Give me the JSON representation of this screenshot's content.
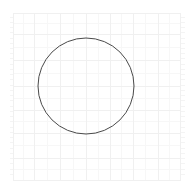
{
  "figure": {
    "width": 191,
    "height": 193,
    "background_color": "#ffffff",
    "title": "",
    "has_axis_labels": false,
    "has_tick_labels": false,
    "has_legend": false
  },
  "plot_area": {
    "left": 13,
    "top": 13,
    "right": 180,
    "bottom": 180,
    "frame_color": "#f0f0f0",
    "background_color": "#ffffff"
  },
  "grid": {
    "visible": true,
    "major_color": "#f0f0f0",
    "minor_color": "#f7f7f7",
    "tick_color": "#f4f4f4",
    "x_major": [
      13,
      34,
      60,
      86,
      110,
      133,
      158,
      180
    ],
    "y_major": [
      13,
      34,
      60,
      86,
      110,
      133,
      158,
      180
    ],
    "x_minor": [
      23,
      47,
      73,
      98,
      121,
      145,
      169
    ],
    "y_minor": [
      23,
      47,
      73,
      98,
      121,
      145,
      169
    ],
    "left_tick_y": [
      17,
      22,
      27,
      32,
      38,
      43,
      48,
      53,
      58,
      64,
      69,
      74,
      79,
      85,
      90,
      95,
      100,
      106,
      111,
      116,
      121,
      127,
      132,
      137,
      142,
      148,
      153,
      158,
      163,
      169,
      174
    ],
    "right_tick_y": [
      17,
      22,
      27,
      32,
      38,
      43,
      48,
      53,
      58,
      64,
      69,
      74,
      79,
      85,
      90,
      95,
      100,
      106,
      111,
      116,
      121,
      127,
      132,
      137,
      142,
      148,
      153,
      158,
      163,
      169,
      174
    ],
    "tick_length": 4
  },
  "chart_data": {
    "type": "scatter",
    "title": "",
    "xlabel": "",
    "ylabel": "",
    "grid": true,
    "legend_position": "none",
    "xlim": [
      13,
      180
    ],
    "ylim": [
      13,
      180
    ],
    "shapes": [
      {
        "name": "circle",
        "kind": "circle",
        "cx": 86,
        "cy": 86,
        "r": 48,
        "stroke": "#4a4a4a",
        "stroke_width": 1,
        "fill": "none"
      }
    ],
    "x": [
      86
    ],
    "y": [
      86
    ],
    "values": [
      48
    ],
    "categories": [
      "circle"
    ],
    "series": [
      {
        "name": "circle",
        "values": [
          48
        ]
      }
    ],
    "annotations": []
  }
}
